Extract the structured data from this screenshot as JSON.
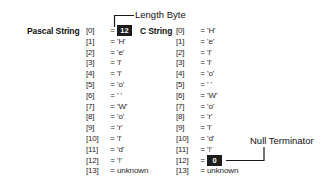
{
  "diagram": {
    "background_color": "#ffffff",
    "text_color": "#262626",
    "highlight_box_color": "#1c1c1c",
    "highlight_text_color": "#ffffff"
  },
  "annotations": {
    "length_byte": "Length Byte",
    "null_terminator": "Null Terminator"
  },
  "pascal": {
    "label": "Pascal String",
    "rows": [
      {
        "index": "[0]",
        "eq": "=",
        "value": "12",
        "highlight": true
      },
      {
        "index": "[1]",
        "eq": "=",
        "value": "'H'",
        "highlight": false
      },
      {
        "index": "[2]",
        "eq": "=",
        "value": "'e'",
        "highlight": false
      },
      {
        "index": "[3]",
        "eq": "=",
        "value": "'l'",
        "highlight": false
      },
      {
        "index": "[4]",
        "eq": "=",
        "value": "'l'",
        "highlight": false
      },
      {
        "index": "[5]",
        "eq": "=",
        "value": "'o'",
        "highlight": false
      },
      {
        "index": "[6]",
        "eq": "=",
        "value": "' '",
        "highlight": false
      },
      {
        "index": "[7]",
        "eq": "=",
        "value": "'W'",
        "highlight": false
      },
      {
        "index": "[8]",
        "eq": "=",
        "value": "'o'",
        "highlight": false
      },
      {
        "index": "[9]",
        "eq": "=",
        "value": "'r'",
        "highlight": false
      },
      {
        "index": "[10]",
        "eq": "=",
        "value": "'l'",
        "highlight": false
      },
      {
        "index": "[11]",
        "eq": "=",
        "value": "'d'",
        "highlight": false
      },
      {
        "index": "[12]",
        "eq": "=",
        "value": "'!'",
        "highlight": false
      },
      {
        "index": "[13]",
        "eq": "=",
        "value": "unknown",
        "highlight": false
      }
    ]
  },
  "cstring": {
    "label": "C String",
    "rows": [
      {
        "index": "[0]",
        "eq": "=",
        "value": "'H'",
        "highlight": false
      },
      {
        "index": "[1]",
        "eq": "=",
        "value": "'e'",
        "highlight": false
      },
      {
        "index": "[2]",
        "eq": "=",
        "value": "'l'",
        "highlight": false
      },
      {
        "index": "[3]",
        "eq": "=",
        "value": "'l'",
        "highlight": false
      },
      {
        "index": "[4]",
        "eq": "=",
        "value": "'o'",
        "highlight": false
      },
      {
        "index": "[5]",
        "eq": "=",
        "value": "' '",
        "highlight": false
      },
      {
        "index": "[6]",
        "eq": "=",
        "value": "'W'",
        "highlight": false
      },
      {
        "index": "[7]",
        "eq": "=",
        "value": "'o'",
        "highlight": false
      },
      {
        "index": "[8]",
        "eq": "=",
        "value": "'r'",
        "highlight": false
      },
      {
        "index": "[9]",
        "eq": "=",
        "value": "'l'",
        "highlight": false
      },
      {
        "index": "[10]",
        "eq": "=",
        "value": "'d'",
        "highlight": false
      },
      {
        "index": "[11]",
        "eq": "=",
        "value": "'!'",
        "highlight": false
      },
      {
        "index": "[12]",
        "eq": "=",
        "value": "0",
        "highlight": true
      },
      {
        "index": "[13]",
        "eq": "=",
        "value": "unknown",
        "highlight": false
      }
    ]
  }
}
